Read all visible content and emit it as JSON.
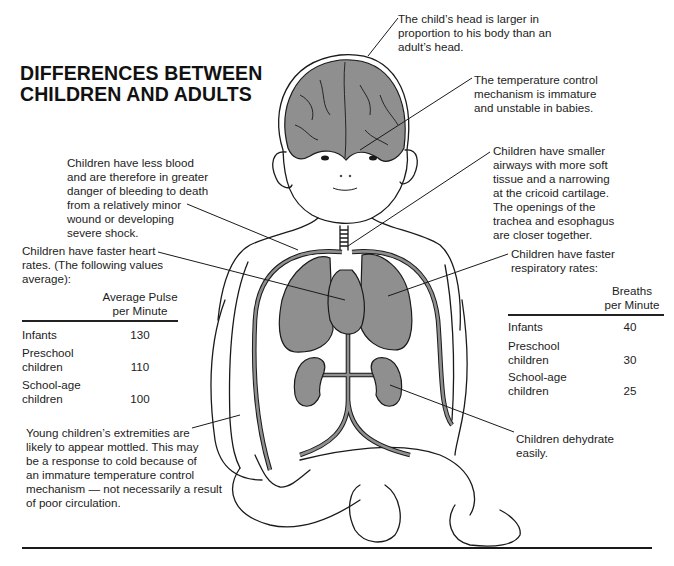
{
  "title": {
    "line1": "DIFFERENCES BETWEEN",
    "line2": "CHILDREN AND ADULTS"
  },
  "notes": {
    "head": [
      "The child’s head is larger in",
      "proportion to his body than an",
      "adult’s head."
    ],
    "temperature": [
      "The temperature control",
      "mechanism is immature",
      "and unstable in babies."
    ],
    "blood": [
      "Children have less blood",
      "and are therefore in greater",
      "danger of bleeding to death",
      "from a relatively minor",
      "wound or developing",
      "severe shock."
    ],
    "airways": [
      "Children have smaller",
      "airways with more soft",
      "tissue and a narrowing",
      "at the cricoid cartilage.",
      "The openings of the",
      "trachea and esophagus",
      "are closer together."
    ],
    "heart": [
      "Children have faster heart",
      "rates. (The following values",
      "average):"
    ],
    "respiratory": [
      "Children have faster",
      "respiratory rates:"
    ],
    "extremities": [
      "Young children’s extremities are",
      "likely to appear mottled. This may",
      "be a response to cold because of",
      "an immature temperature control",
      "mechanism — not necessarily a result",
      "of poor circulation."
    ],
    "dehydrate": [
      "Children dehydrate",
      "easily."
    ]
  },
  "pulse_table": {
    "header": [
      "Average Pulse",
      "per Minute"
    ],
    "rows": [
      {
        "label": [
          "Infants"
        ],
        "value": "130"
      },
      {
        "label": [
          "Preschool",
          "children"
        ],
        "value": "110"
      },
      {
        "label": [
          "School-age",
          "children"
        ],
        "value": "100"
      }
    ]
  },
  "breath_table": {
    "header": [
      "Breaths",
      "per Minute"
    ],
    "rows": [
      {
        "label": [
          "Infants"
        ],
        "value": "40"
      },
      {
        "label": [
          "Preschool",
          "children"
        ],
        "value": "30"
      },
      {
        "label": [
          "School-age",
          "children"
        ],
        "value": "25"
      }
    ]
  },
  "colors": {
    "organ_fill": "#8f8f8f",
    "line": "#1a1a1a"
  }
}
